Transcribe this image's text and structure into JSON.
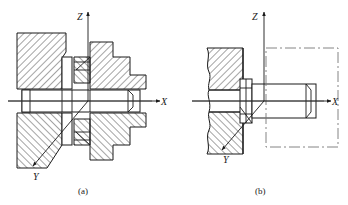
{
  "figure": {
    "title_absent": true,
    "background_color": "#ffffff",
    "line_color": "#1a1a1a",
    "hatch_color": "#1a1a1a",
    "centerline_color": "#555555"
  },
  "subfigures": [
    {
      "id": "a",
      "caption": "(a)",
      "description": "full-section assembly drawing of bolted joint",
      "axes": {
        "z_label": "Z",
        "x_label": "X",
        "y_label": "Y"
      }
    },
    {
      "id": "b",
      "caption": "(b)",
      "description": "partial-section drawing of bolt in plate with phantom outline",
      "axes": {
        "z_label": "Z",
        "x_label": "X",
        "y_label": "Y"
      }
    }
  ],
  "captions": {
    "a": "(a)",
    "b": "(b)"
  },
  "axis_labels": {
    "z": "Z",
    "x": "X",
    "y": "Y"
  }
}
